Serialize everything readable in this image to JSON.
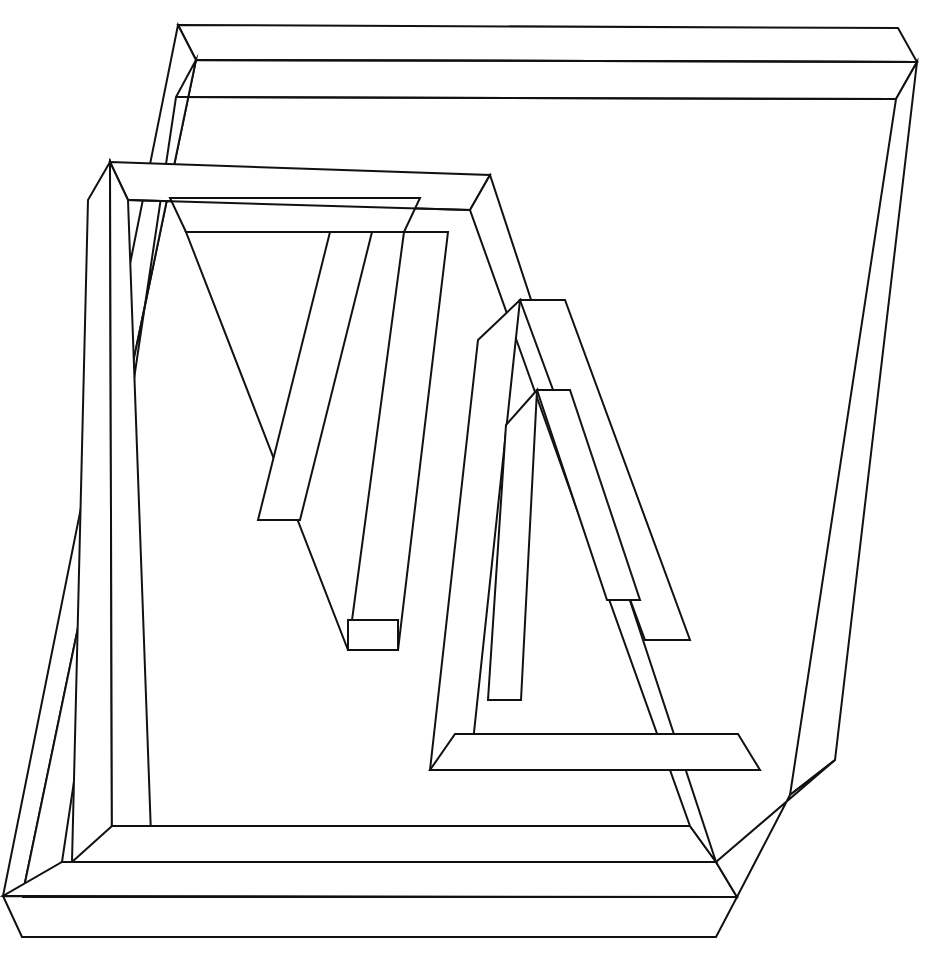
{
  "document": {
    "title": "Interlocking Impossible Triangles",
    "description": "Black-and-white line drawing of three interwoven Penrose-style impossible triangles (tribars) drawn as flat outlined ribbons.",
    "kind": "line-art illustration",
    "canvas": {
      "width": 932,
      "height": 960
    },
    "background_color": "#ffffff",
    "stroke_color": "#111111",
    "stroke_width": 2,
    "fill_color": "#ffffff"
  },
  "figure": {
    "shape_count": 3,
    "shapes": [
      {
        "id": "triangle-large-right",
        "label": "Large downward triangle (right / back)",
        "orientation": "apex-down",
        "bounds": {
          "x": 3,
          "y": 25,
          "width": 914,
          "height": 935
        }
      },
      {
        "id": "triangle-medium-left",
        "label": "Medium downward triangle (left / middle)",
        "orientation": "apex-down",
        "bounds": {
          "x": 88,
          "y": 162,
          "width": 750,
          "height": 670
        }
      },
      {
        "id": "triangle-small-inner",
        "label": "Small downward triangle (inner / front)",
        "orientation": "apex-down",
        "bounds": {
          "x": 170,
          "y": 198,
          "width": 590,
          "height": 580
        }
      }
    ],
    "paths": {
      "A_outer": "M 178,25 L 898,28 L 917,62 L 835,760 L 820,770 L 770,800 L 22,935 L 3,895 L 160,60 Z",
      "note": "Geometry is emitted as explicit polygon faces below."
    },
    "faces": [
      {
        "name": "back-triangle-top-beam-top",
        "d": "M 178,25 L 898,28 L 917,62 L 196,60 Z"
      },
      {
        "name": "back-triangle-top-beam-front",
        "d": "M 196,60 L 917,62 L 895,100 L 174,98 Z"
      },
      {
        "name": "back-triangle-left-beam",
        "d": "M 178,25 L 196,60 L 22,935 L 3,895 Z"
      },
      {
        "name": "back-triangle-left-beam-inner",
        "d": "M 196,60 L 236,92 L 62,870 L 22,935 Z"
      },
      {
        "name": "back-triangle-bottom-beam-top",
        "d": "M 22,935 L 770,800 L 820,770 L 3,895 Z"
      },
      {
        "name": "back-triangle-right-beam",
        "d": "M 917,62 L 835,760 L 790,795 L 895,100 Z"
      },
      {
        "name": "mid-triangle-top-beam",
        "d": "M 110,162 L 490,175 L 470,210 L 128,200 Z"
      },
      {
        "name": "mid-triangle-left-beam",
        "d": "M 110,162 L 88,200 L 72,860 L 108,862 Z"
      },
      {
        "name": "mid-triangle-bottom-beam",
        "d": "M 72,860 L 660,800 L 700,770 L 108,862 Z"
      },
      {
        "name": "inner-triangle-top-beam",
        "d": "M 170,198 L 420,198 L 404,232 L 186,232 Z"
      },
      {
        "name": "inner-triangle-apex",
        "d": "M 348,650 L 398,650 L 372,620 Z"
      }
    ]
  },
  "viewer": {
    "zoom_percent": 100,
    "tool": "none"
  }
}
